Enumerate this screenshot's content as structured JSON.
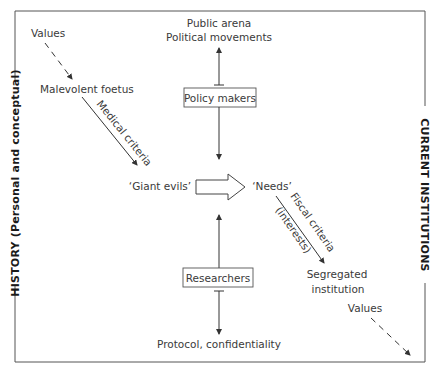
{
  "diagram": {
    "left_axis_label": "HISTORY (Personal and conceptual)",
    "right_axis_label": "CURRENT INSTITUTIONS",
    "top_node": {
      "line1": "Public arena",
      "line2": "Political movements"
    },
    "policy_makers_box": "Policy makers",
    "researchers_box": "Researchers",
    "bottom_node": "Protocol, confidentiality",
    "values_top": "Values",
    "malevolent_foetus": "Malevolent foetus",
    "medical_criteria": "Medical criteria",
    "giant_evils": "‘Giant evils’",
    "needs": "‘Needs’",
    "fiscal_criteria": "Fiscal criteria",
    "interests": "(interests)",
    "segregated_institution": {
      "line1": "Segregated",
      "line2": "institution"
    },
    "values_bottom": "Values"
  },
  "colors": {
    "text": "#3a3a3a",
    "axis_label": "#1a1a1a",
    "lines": "#333333",
    "background": "#ffffff"
  }
}
